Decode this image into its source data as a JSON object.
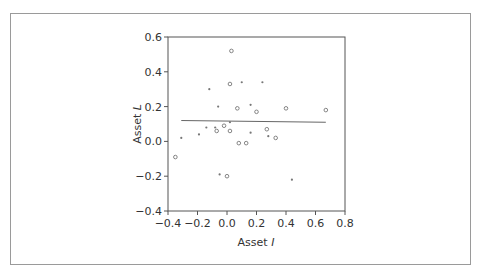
{
  "chart_data": {
    "type": "scatter",
    "title": "",
    "xlabel": "Asset I",
    "ylabel": "Asset L",
    "xlabel_main": "Asset ",
    "xlabel_var": "I",
    "ylabel_main": "Asset ",
    "ylabel_var": "L",
    "xlim": [
      -0.4,
      0.8
    ],
    "ylim": [
      -0.4,
      0.6
    ],
    "xticks": [
      "-0.4",
      "-0.2",
      "0.0",
      "0.2",
      "0.4",
      "0.6",
      "0.8"
    ],
    "yticks": [
      "0.6",
      "0.4",
      "0.2",
      "0.0",
      "-0.2",
      "-0.4"
    ],
    "grid": false,
    "legend": null,
    "points": [
      {
        "x": -0.35,
        "y": -0.09,
        "marker": "circle"
      },
      {
        "x": -0.31,
        "y": 0.02,
        "marker": "dot"
      },
      {
        "x": -0.19,
        "y": 0.04,
        "marker": "dot"
      },
      {
        "x": -0.14,
        "y": 0.08,
        "marker": "dot"
      },
      {
        "x": -0.12,
        "y": 0.3,
        "marker": "dot"
      },
      {
        "x": -0.08,
        "y": 0.08,
        "marker": "dot"
      },
      {
        "x": -0.07,
        "y": 0.06,
        "marker": "circle"
      },
      {
        "x": -0.06,
        "y": 0.2,
        "marker": "dot"
      },
      {
        "x": -0.05,
        "y": -0.19,
        "marker": "dot"
      },
      {
        "x": -0.02,
        "y": 0.09,
        "marker": "circle"
      },
      {
        "x": 0.0,
        "y": -0.2,
        "marker": "circle"
      },
      {
        "x": 0.02,
        "y": 0.11,
        "marker": "dot"
      },
      {
        "x": 0.02,
        "y": 0.33,
        "marker": "circle"
      },
      {
        "x": 0.02,
        "y": 0.06,
        "marker": "circle"
      },
      {
        "x": 0.03,
        "y": 0.52,
        "marker": "circle"
      },
      {
        "x": 0.07,
        "y": 0.19,
        "marker": "circle"
      },
      {
        "x": 0.08,
        "y": -0.01,
        "marker": "circle"
      },
      {
        "x": 0.1,
        "y": 0.34,
        "marker": "dot"
      },
      {
        "x": 0.13,
        "y": -0.01,
        "marker": "circle"
      },
      {
        "x": 0.16,
        "y": 0.05,
        "marker": "dot"
      },
      {
        "x": 0.16,
        "y": 0.21,
        "marker": "dot"
      },
      {
        "x": 0.2,
        "y": 0.17,
        "marker": "circle"
      },
      {
        "x": 0.24,
        "y": 0.34,
        "marker": "dot"
      },
      {
        "x": 0.27,
        "y": 0.07,
        "marker": "circle"
      },
      {
        "x": 0.28,
        "y": 0.03,
        "marker": "dot"
      },
      {
        "x": 0.33,
        "y": 0.02,
        "marker": "circle"
      },
      {
        "x": 0.4,
        "y": 0.19,
        "marker": "circle"
      },
      {
        "x": 0.44,
        "y": -0.22,
        "marker": "dot"
      },
      {
        "x": 0.67,
        "y": 0.18,
        "marker": "circle"
      }
    ],
    "regression_line": {
      "x": [
        -0.31,
        0.67
      ],
      "y": [
        0.12,
        0.11
      ]
    }
  },
  "colors": {
    "frame": "#9a9a9a",
    "axis": "#555555",
    "marker": "#777777",
    "line": "#666666",
    "text": "#333333"
  }
}
